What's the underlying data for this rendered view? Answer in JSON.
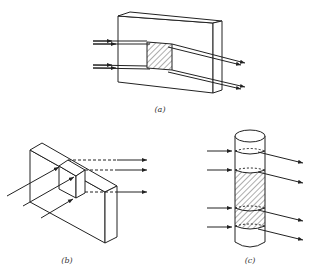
{
  "figure": {
    "panels": [
      {
        "id": "a",
        "label": "(a)",
        "shape": "rectangular slab",
        "region": "square hatched region",
        "beams": 4
      },
      {
        "id": "b",
        "label": "(b)",
        "shape": "rectangular slab in oblique view",
        "region": "cube",
        "beams": 3
      },
      {
        "id": "c",
        "label": "(c)",
        "shape": "cylinder",
        "region": "hatched cylindrical section",
        "beams": 4
      }
    ]
  },
  "colors": {
    "line": "#222222",
    "background": "#ffffff"
  }
}
